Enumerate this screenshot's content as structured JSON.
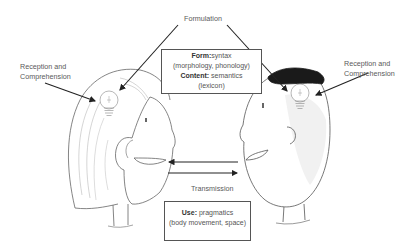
{
  "diagram": {
    "type": "communication-model",
    "labels": {
      "formulation": "Formulation",
      "reception_left": [
        "Reception and",
        "Comprehension"
      ],
      "reception_right": [
        "Reception and",
        "Comprehension"
      ],
      "transmission": "Transmission"
    },
    "form_box": {
      "form_label": "Form:",
      "form_value": "syntax",
      "form_detail": "(morphology, phonology)",
      "content_label": "Content:",
      "content_value": " semantics",
      "content_detail": "(lexicon)"
    },
    "use_box": {
      "use_label": "Use:",
      "use_value": " pragmatics",
      "use_detail": "(body movement, space)"
    },
    "figures": [
      {
        "name": "left-person",
        "description": "woman with long hair, lightbulb in head, facing right"
      },
      {
        "name": "right-person",
        "description": "man with dark hair, lightbulb in head, facing left"
      }
    ],
    "arrows": [
      {
        "from": "formulation",
        "to": "left-lightbulb"
      },
      {
        "from": "formulation",
        "to": "right-lightbulb"
      },
      {
        "from": "reception-left-label",
        "to": "left-lightbulb"
      },
      {
        "from": "reception-right-label",
        "to": "right-lightbulb"
      },
      {
        "from": "right-mouth",
        "to": "left-mouth"
      },
      {
        "from": "left-mouth",
        "to": "right-mouth"
      }
    ]
  }
}
